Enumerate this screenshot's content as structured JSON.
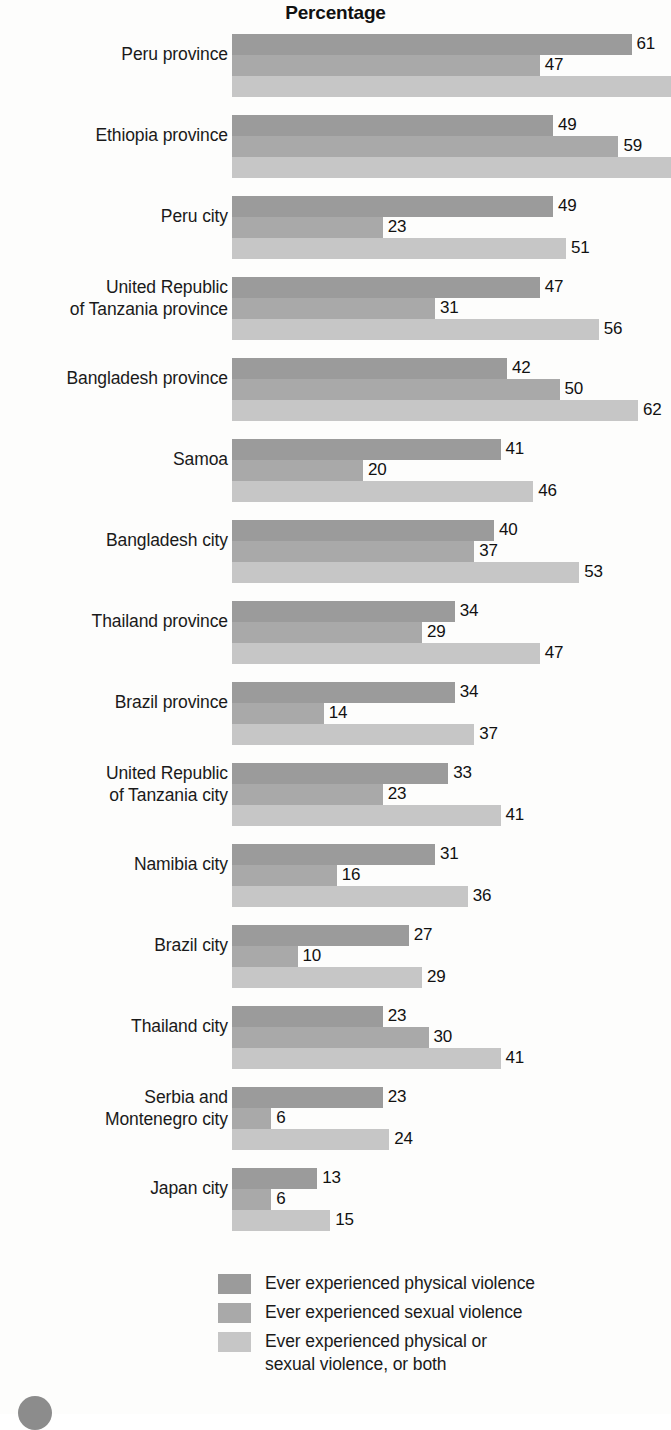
{
  "chart_data": {
    "type": "bar",
    "orientation": "horizontal",
    "title": "Percentage",
    "xlabel": "",
    "ylabel": "",
    "xlim": [
      0,
      67
    ],
    "grid": false,
    "legend_position": "bottom",
    "axis_max_visible": 67,
    "categories": [
      "Peru province",
      "Ethiopia province",
      "Peru city",
      "United Republic\nof Tanzania province",
      "Bangladesh province",
      "Samoa",
      "Bangladesh city",
      "Thailand province",
      "Brazil province",
      "United Republic\nof Tanzania city",
      "Namibia city",
      "Brazil city",
      "Thailand city",
      "Serbia and\nMontenegro city",
      "Japan city"
    ],
    "series": [
      {
        "name": "Ever experienced physical violence",
        "color": "#9b9b9b",
        "values": [
          61,
          49,
          49,
          47,
          42,
          41,
          40,
          34,
          34,
          33,
          31,
          27,
          23,
          23,
          13
        ]
      },
      {
        "name": "Ever experienced sexual violence",
        "color": "#a9a9a9",
        "values": [
          47,
          59,
          23,
          31,
          50,
          20,
          37,
          29,
          14,
          23,
          16,
          10,
          30,
          6,
          6
        ]
      },
      {
        "name": "Ever experienced physical or sexual violence, or both",
        "color": "#c6c6c6",
        "values": [
          67,
          71,
          51,
          56,
          62,
          46,
          53,
          47,
          37,
          41,
          36,
          29,
          41,
          24,
          15
        ]
      }
    ],
    "value_labels": [
      [
        61,
        47,
        ""
      ],
      [
        49,
        59,
        ""
      ],
      [
        49,
        23,
        51
      ],
      [
        47,
        31,
        56
      ],
      [
        42,
        50,
        62
      ],
      [
        41,
        20,
        46
      ],
      [
        40,
        37,
        53
      ],
      [
        34,
        29,
        47
      ],
      [
        34,
        14,
        37
      ],
      [
        33,
        23,
        41
      ],
      [
        31,
        16,
        36
      ],
      [
        27,
        10,
        29
      ],
      [
        23,
        30,
        41
      ],
      [
        23,
        6,
        24
      ],
      [
        13,
        6,
        15
      ]
    ]
  },
  "legend": {
    "items": [
      {
        "label": "Ever experienced physical violence",
        "color": "#9b9b9b",
        "swatch": "legend-swatch-physical"
      },
      {
        "label": "Ever experienced sexual violence",
        "color": "#a9a9a9",
        "swatch": "legend-swatch-sexual"
      },
      {
        "label": "Ever experienced physical or\nsexual violence, or both",
        "color": "#c6c6c6",
        "swatch": "legend-swatch-either"
      }
    ]
  }
}
